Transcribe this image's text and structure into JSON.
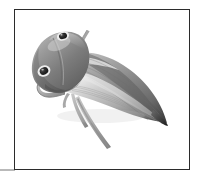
{
  "figure": {
    "common_name": "leafhopper",
    "caption": "",
    "rendering": "grayscale photographic illustration",
    "background_color": "#ffffff",
    "frame": {
      "border_color": "#2b2b2b",
      "border_width_px": 1,
      "left_px": 14,
      "top_px": 9,
      "width_px": 176,
      "height_px": 161
    },
    "edge_artifact": {
      "color": "#b9b9b9",
      "left_px": 0,
      "top_px": 169,
      "width_px": 15,
      "height_px": 2
    },
    "palette": {
      "darkest": "#2f2f2f",
      "dark": "#595959",
      "mid": "#8a8a8a",
      "light": "#b5b5b5",
      "lightest": "#e2e2e2",
      "highlight": "#f3f3f3",
      "eye_pupil": "#1f1f1f",
      "eye_ring": "#ededed"
    },
    "anatomy": {
      "head": {
        "label": "head-pronotum",
        "center_px": [
          52,
          60
        ],
        "tone": "#777777"
      },
      "eye_upper": {
        "label": "upper-compound-eye",
        "center_px": [
          62,
          39
        ],
        "radius_px": 4,
        "pupil_color": "#1f1f1f",
        "ring_color": "#ededed"
      },
      "eye_lower": {
        "label": "lower-compound-eye",
        "center_px": [
          44,
          72
        ],
        "radius_px": 5,
        "pupil_color": "#232323",
        "ring_color": "#ededed"
      },
      "forewing_upper": {
        "label": "upper-forewing",
        "tone": "#8e8e8e",
        "tip_px": [
          163,
          122
        ]
      },
      "forewing_lower": {
        "label": "lower-forewing",
        "tone": "#a9a9a9",
        "tip_px": [
          161,
          124
        ]
      },
      "antenna": {
        "label": "antenna-bristle",
        "from_px": [
          72,
          56
        ],
        "to_px": [
          84,
          28
        ],
        "tone": "#9d9d9d"
      },
      "foreleg_hooked": {
        "label": "hooked-foreleg",
        "tone": "#b0b0b0",
        "from_px": [
          62,
          96
        ],
        "to_px": [
          41,
          108
        ]
      },
      "hindleg_long": {
        "label": "long-hindleg",
        "tone": "#a6a6a6",
        "from_px": [
          74,
          100
        ],
        "to_px": [
          108,
          146
        ]
      }
    }
  }
}
